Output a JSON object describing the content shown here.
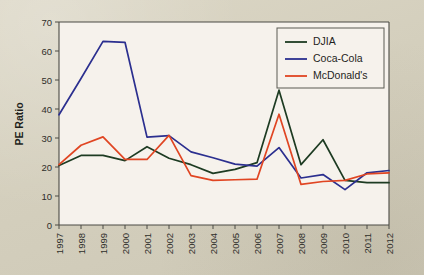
{
  "chart_data": {
    "type": "line",
    "title": "",
    "xlabel": "",
    "ylabel": "PE Ratio",
    "ylim": [
      0,
      70
    ],
    "yticks": [
      0,
      10,
      20,
      30,
      40,
      50,
      60,
      70
    ],
    "grid": false,
    "legend_position": "top-right",
    "categories": [
      "1997",
      "1998",
      "1999",
      "2000",
      "2001",
      "2002",
      "2003",
      "2004",
      "2005",
      "2006",
      "2007",
      "2008",
      "2009",
      "2010",
      "2011",
      "2012"
    ],
    "series": [
      {
        "name": "DJIA",
        "color": "#1d3b22",
        "values": [
          20.5,
          24.0,
          24.0,
          22.2,
          27.0,
          23.0,
          20.8,
          17.8,
          19.2,
          21.5,
          46.5,
          20.8,
          29.4,
          15.4,
          14.6,
          14.6
        ]
      },
      {
        "name": "Coca-Cola",
        "color": "#2b2f8f",
        "values": [
          38.0,
          50.5,
          63.3,
          63.0,
          30.3,
          30.8,
          25.2,
          23.2,
          21.0,
          20.3,
          26.7,
          16.2,
          17.4,
          12.2,
          18.0,
          18.8
        ]
      },
      {
        "name": "McDonald's",
        "color": "#e04522",
        "values": [
          20.8,
          27.5,
          30.4,
          22.6,
          22.6,
          30.9,
          17.0,
          15.4,
          15.6,
          15.8,
          38.2,
          14.0,
          15.0,
          15.4,
          17.6,
          18.0
        ]
      }
    ]
  },
  "axes": {
    "ylabel": "PE Ratio",
    "ytick_labels": [
      "0",
      "10",
      "20",
      "30",
      "40",
      "50",
      "60",
      "70"
    ],
    "xtick_labels": [
      "1997",
      "1998",
      "1999",
      "2000",
      "2001",
      "2002",
      "2003",
      "2004",
      "2005",
      "2006",
      "2007",
      "2008",
      "2009",
      "2010",
      "2011",
      "2012"
    ]
  },
  "legend": {
    "entries": [
      {
        "label": "DJIA",
        "color": "#1d3b22"
      },
      {
        "label": "Coca-Cola",
        "color": "#2b2f8f"
      },
      {
        "label": "McDonald's",
        "color": "#e04522"
      }
    ]
  },
  "colors": {
    "page_background": "#d7d2c0",
    "plot_background": "#f6f2ec",
    "axis": "#4a4a44",
    "djia": "#1d3b22",
    "coca_cola": "#2b2f8f",
    "mcdonalds": "#e04522"
  }
}
